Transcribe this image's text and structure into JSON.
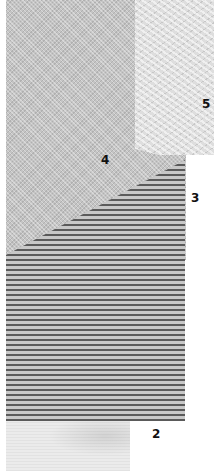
{
  "image": {
    "description": "Photographic collage of four overlapping fabric swatches with numeric labels",
    "swatches": [
      {
        "id": "5",
        "label": "5",
        "texture": "herringbone",
        "tone": "#dedede"
      },
      {
        "id": "4",
        "label": "4",
        "texture": "fine twill",
        "tone": "#c4c4c4"
      },
      {
        "id": "3",
        "label": "3",
        "texture": "horizontal rib stripes",
        "tone": "#8a8a8a"
      },
      {
        "id": "2",
        "label": "2",
        "texture": "plain weave",
        "tone": "#ebebeb"
      }
    ]
  }
}
